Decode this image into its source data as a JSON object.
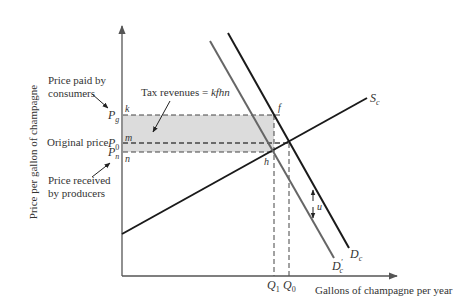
{
  "diagram": {
    "type": "economics-tax-incidence",
    "y_axis_label": "Price per gallon of champagne",
    "x_axis_label": "Gallons of champagne per year",
    "curves": {
      "supply": {
        "label": "S",
        "subscript": "c",
        "color": "#1a1a1a"
      },
      "demand": {
        "label": "D",
        "subscript": "c",
        "color": "#1a1a1a"
      },
      "demand_shifted": {
        "label": "D",
        "prime": "′",
        "subscript": "c",
        "color": "#666666"
      }
    },
    "price_levels": {
      "pg": {
        "symbol": "P",
        "subscript": "g",
        "point": "k"
      },
      "p0": {
        "symbol": "P",
        "subscript": "0",
        "point": "m"
      },
      "pn": {
        "symbol": "P",
        "subscript": "n",
        "point": "n"
      }
    },
    "quantities": {
      "q1": {
        "symbol": "Q",
        "subscript": "1"
      },
      "q0": {
        "symbol": "Q",
        "subscript": "0"
      }
    },
    "points": {
      "f": "f",
      "h": "h"
    },
    "shift_label": "u",
    "annotations": {
      "consumers_line1": "Price paid by",
      "consumers_line2": "consumers",
      "original_price": "Original price",
      "producers_line1": "Price received",
      "producers_line2": "by producers",
      "tax_revenues_prefix": "Tax revenues = ",
      "tax_revenues_area": "kfhn"
    },
    "colors": {
      "shaded_area": "#dcdcdc",
      "axis": "#555555",
      "dashed": "#444444"
    }
  }
}
